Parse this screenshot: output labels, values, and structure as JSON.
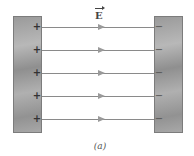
{
  "diagram": {
    "type": "parallel-plate-capacitor-field",
    "field_label": "E",
    "field_label_is_vector": true,
    "caption": "(a)",
    "left_plate": {
      "charge": "positive",
      "signs": [
        "+",
        "+",
        "+",
        "+",
        "+"
      ]
    },
    "right_plate": {
      "charge": "negative",
      "signs": [
        "−",
        "−",
        "−",
        "−",
        "−"
      ]
    },
    "field_lines": {
      "count": 5,
      "direction": "left-to-right",
      "y_positions": [
        27,
        50,
        73,
        96,
        119
      ]
    },
    "colors": {
      "plate": "#a0a0a0",
      "field_line": "#8a8a8a",
      "arrow": "#9a9a9a",
      "text": "#444444"
    }
  }
}
